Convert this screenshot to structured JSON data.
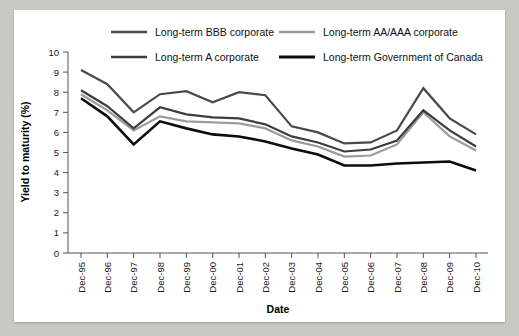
{
  "chart_data": {
    "type": "line",
    "title": "",
    "xlabel": "Date",
    "ylabel": "Yield to maturity (%)",
    "ylim": [
      0,
      10
    ],
    "ytick_labels": [
      "0",
      "1",
      "2",
      "3",
      "4",
      "5",
      "6",
      "7",
      "8",
      "9",
      "10"
    ],
    "ytick_values": [
      0,
      1,
      2,
      3,
      4,
      5,
      6,
      7,
      8,
      9,
      10
    ],
    "grid": false,
    "legend_position": "top",
    "categories": [
      "Dec-95",
      "Dec-96",
      "Dec-97",
      "Dec-98",
      "Dec-99",
      "Dec-00",
      "Dec-01",
      "Dec-02",
      "Dec-03",
      "Dec-04",
      "Dec-05",
      "Dec-06",
      "Dec-07",
      "Dec-08",
      "Dec-09",
      "Dec-10"
    ],
    "series": [
      {
        "name": "Long-term BBB corporate",
        "color": "#4a4a4a",
        "width": 2.2,
        "values": [
          9.1,
          8.4,
          7.0,
          7.9,
          8.05,
          7.5,
          8.0,
          7.85,
          6.3,
          6.0,
          5.45,
          5.5,
          6.1,
          8.2,
          6.7,
          5.9
        ]
      },
      {
        "name": "Long-term AA/AAA corporate",
        "color": "#9b9b9b",
        "width": 2.2,
        "values": [
          7.9,
          7.1,
          6.1,
          6.8,
          6.55,
          6.5,
          6.45,
          6.2,
          5.6,
          5.3,
          4.8,
          4.85,
          5.4,
          7.0,
          5.8,
          5.1
        ]
      },
      {
        "name": "Long-term A corporate",
        "color": "#3d3d3d",
        "width": 2.2,
        "values": [
          8.1,
          7.3,
          6.2,
          7.25,
          6.9,
          6.75,
          6.7,
          6.4,
          5.8,
          5.5,
          5.05,
          5.15,
          5.6,
          7.1,
          6.1,
          5.3
        ]
      },
      {
        "name": "Long-term Government of Canada",
        "color": "#0d0d0d",
        "width": 2.6,
        "values": [
          7.7,
          6.8,
          5.4,
          6.55,
          6.2,
          5.9,
          5.8,
          5.55,
          5.2,
          4.9,
          4.35,
          4.35,
          4.45,
          4.5,
          4.55,
          4.1
        ]
      }
    ]
  },
  "axis": {
    "y_title": "Yield to maturity (%)",
    "x_title": "Date"
  }
}
